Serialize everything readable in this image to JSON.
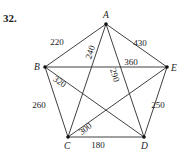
{
  "problem_number": "32.",
  "colors": {
    "ink": "#1a1a1a",
    "edge": "#2a2a2a",
    "background": "#ffffff"
  },
  "vertices": [
    {
      "id": "A",
      "label": "A",
      "x": 106,
      "y": 24,
      "lx": 103,
      "ly": 18
    },
    {
      "id": "B",
      "label": "B",
      "x": 45,
      "y": 67,
      "lx": 34,
      "ly": 70
    },
    {
      "id": "C",
      "label": "C",
      "x": 68,
      "y": 137,
      "lx": 64,
      "ly": 149
    },
    {
      "id": "D",
      "label": "D",
      "x": 144,
      "y": 137,
      "lx": 141,
      "ly": 149
    },
    {
      "id": "E",
      "label": "E",
      "x": 167,
      "y": 67,
      "lx": 171,
      "ly": 71
    }
  ],
  "edges": [
    {
      "from": "A",
      "to": "B",
      "weight": "220",
      "lx": 57,
      "ly": 45,
      "rot": 0
    },
    {
      "from": "A",
      "to": "E",
      "weight": "430",
      "lx": 140,
      "ly": 46,
      "rot": 0
    },
    {
      "from": "A",
      "to": "C",
      "weight": "240",
      "lx": 93,
      "ly": 53,
      "rot": -72
    },
    {
      "from": "A",
      "to": "D",
      "weight": "290",
      "lx": 112,
      "ly": 76,
      "rot": 72
    },
    {
      "from": "B",
      "to": "E",
      "weight": "360",
      "lx": 131,
      "ly": 65,
      "rot": 0
    },
    {
      "from": "B",
      "to": "D",
      "weight": "320",
      "lx": 58,
      "ly": 84,
      "rot": 35
    },
    {
      "from": "B",
      "to": "C",
      "weight": "260",
      "lx": 39,
      "ly": 108,
      "rot": 0
    },
    {
      "from": "C",
      "to": "E",
      "weight": "300",
      "lx": 87,
      "ly": 131,
      "rot": -38
    },
    {
      "from": "C",
      "to": "D",
      "weight": "180",
      "lx": 98,
      "ly": 148,
      "rot": 0
    },
    {
      "from": "D",
      "to": "E",
      "weight": "250",
      "lx": 158,
      "ly": 108,
      "rot": 0
    }
  ]
}
